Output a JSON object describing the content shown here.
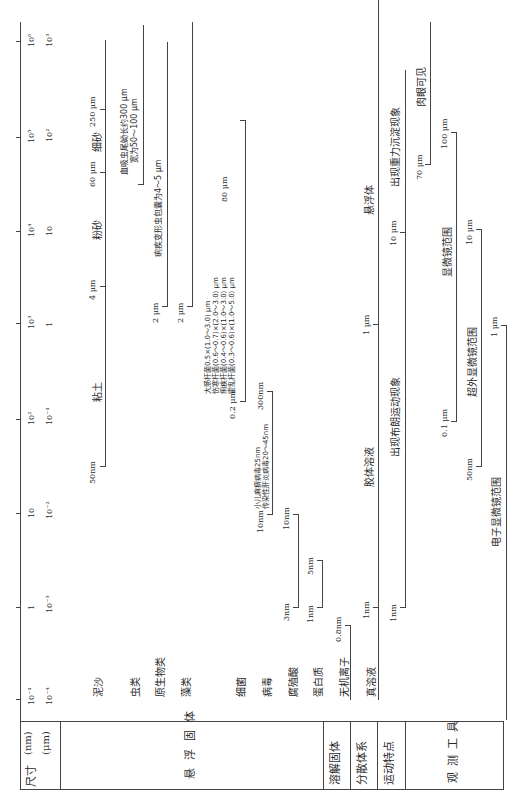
{
  "header": {
    "size_label": "尺寸",
    "unit_nm": "(nm)",
    "unit_um": "(μm)",
    "suspended_solids": "悬浮固体",
    "dissolved_solids": "溶解固体",
    "dispersion_system": "分散体系",
    "motion_features": "运动特点",
    "observation_tools": "观测工具"
  },
  "axis": {
    "nm_ticks": [
      "10⁻¹",
      "1",
      "10",
      "10²",
      "10³",
      "10⁴",
      "10⁵",
      "10⁶"
    ],
    "um_ticks": [
      "10⁻⁴",
      "10⁻³",
      "10⁻²",
      "10⁻¹",
      "1",
      "10",
      "10²",
      "10³"
    ]
  },
  "rows": {
    "mud_sand": {
      "label": "泥沙",
      "clay": "粘土",
      "silt": "粉砂",
      "fine_sand": "细砂",
      "v_50nm": "50nm",
      "v_4um": "4 μm",
      "v_60um": "60 μm",
      "v_250um": "250 μm"
    },
    "worms": {
      "label": "虫类",
      "note1": "血吸虫尾蚴长约300 μm",
      "note2": "宽为50～100 μm"
    },
    "protozoa": {
      "label": "原生物类",
      "note": "痢疾变形虫包囊为4～5 μm",
      "v_2um": "2 μm"
    },
    "algae": {
      "label": "藻类",
      "v_2um": "2 μm"
    },
    "bacteria": {
      "label": "细菌",
      "v_min": "0.2 μm",
      "v_max": "80 μm",
      "lines": [
        "大肠杆菌0.5×(1.0～3.0) μm",
        "伤寒杆菌(0.6～0.7)×(2.0～3.0) μm",
        "痢疾杆菌(0.4～0.6)×(1.0～3.0) μm",
        "霍乱杆菌(0.3～0.6)×(1.0～5.0) μm"
      ]
    },
    "virus": {
      "label": "病毒",
      "v_min": "10nm",
      "v_max": "300nm",
      "note1": "小儿麻痹病毒25nm",
      "note2": "传染性肝炎病毒20～45nm"
    },
    "humic_acid": {
      "label": "腐殖酸",
      "v_min": "3nm",
      "v_max": "10nm"
    },
    "protein": {
      "label": "蛋白质",
      "v_min": "1nm",
      "v_max": "5nm"
    },
    "inorganic_ions": {
      "label": "无机离子",
      "v_max": "0.8nm"
    },
    "dispersion": {
      "true_solution": "真溶液",
      "colloid": "胶体溶液",
      "suspension": "悬浮体",
      "v_1nm": "1nm",
      "v_1um": "1 μm"
    },
    "motion": {
      "brownian": "出现布朗运动现象",
      "sedimentation": "出现重力沉淀现象",
      "v_1nm": "1nm",
      "v_10um": "10 μm"
    },
    "tools": {
      "naked_eye": "肉眼可见",
      "naked_eye_min": "70 μm",
      "microscope": "显微镜范围",
      "microscope_min": "0.1 μm",
      "microscope_max": "100 μm",
      "ultra_microscope": "超外显微镜范围",
      "ultra_min": "50nm",
      "ultra_max": "10 μm",
      "electron_microscope": "电子显微镜范围",
      "electron_max": "1 μm"
    }
  }
}
